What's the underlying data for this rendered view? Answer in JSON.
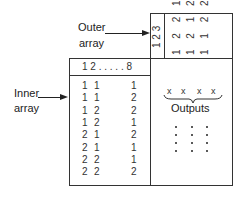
{
  "labels": {
    "outer_line1": "Outer",
    "outer_line2": "array",
    "inner_line1": "Inner",
    "inner_line2": "array",
    "outputs": "Outputs"
  },
  "outer_array": {
    "factor_header": "1 2 3",
    "rotated_rows_display": [
      "1 2 2 1",
      "1 2 1 2",
      "1 1 2 2"
    ],
    "runs": [
      [
        1,
        1,
        1
      ],
      [
        1,
        2,
        2
      ],
      [
        2,
        1,
        2
      ],
      [
        2,
        2,
        1
      ]
    ]
  },
  "inner_array": {
    "header": "1 2 . . . . . 8",
    "rows": [
      {
        "c1": "1",
        "c2": "1",
        "c8": "1"
      },
      {
        "c1": "1",
        "c2": "1",
        "c8": "2"
      },
      {
        "c1": "1",
        "c2": "2",
        "c8": "2"
      },
      {
        "c1": "1",
        "c2": "2",
        "c8": "1"
      },
      {
        "c1": "2",
        "c2": "1",
        "c8": "2"
      },
      {
        "c1": "2",
        "c2": "1",
        "c8": "1"
      },
      {
        "c1": "2",
        "c2": "2",
        "c8": "1"
      },
      {
        "c1": "2",
        "c2": "2",
        "c8": "2"
      }
    ]
  },
  "outputs": {
    "marks": [
      "x",
      "x",
      "x",
      "x"
    ]
  }
}
